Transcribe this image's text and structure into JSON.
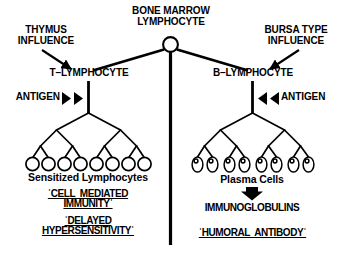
{
  "diagram": {
    "colors": {
      "ink": "#000000",
      "background": "#ffffff"
    },
    "nodes": {
      "origin_line1": "BONE MARROW",
      "origin_line2": "LYMPHOCYTE",
      "thymus_line1": "THYMUS",
      "thymus_line2": "INFLUENCE",
      "bursa_line1": "BURSA TYPE",
      "bursa_line2": "INFLUENCE",
      "t_cell": "T–LYMPHOCYTE",
      "b_cell": "B–LYMPHOCYTE",
      "antigen_left": "ANTIGEN",
      "antigen_right": "ANTIGEN"
    },
    "left_branch": {
      "product_label": "Sensitized Lymphocytes",
      "outcome_1_line1": "ˈCELL  MEDIATED",
      "outcome_1_line2": "IMMUNITYˈ",
      "outcome_2_line1": "ˈDELAYED",
      "outcome_2_line2": "HYPERSENSITIVITYˈ",
      "cell_count": 8,
      "cell_shape": "circle"
    },
    "right_branch": {
      "product_label": "Plasma Cells",
      "secretion": "IMMUNOGLOBULINS",
      "outcome_line": "ˈHUMORAL  ANTIBODYˈ",
      "cell_count": 8,
      "cell_shape": "oval-with-nucleus"
    },
    "icons": {
      "origin_node": "open-circle-icon",
      "antigen_left_arrows": "double-right-triangle-icon",
      "antigen_right_arrows": "double-left-triangle-icon",
      "secretion_arrow": "down-block-arrow-icon",
      "thymus_arrow": "diagonal-arrow-icon",
      "bursa_arrow": "diagonal-arrow-icon",
      "center_divider": "vertical-divider-icon"
    }
  }
}
